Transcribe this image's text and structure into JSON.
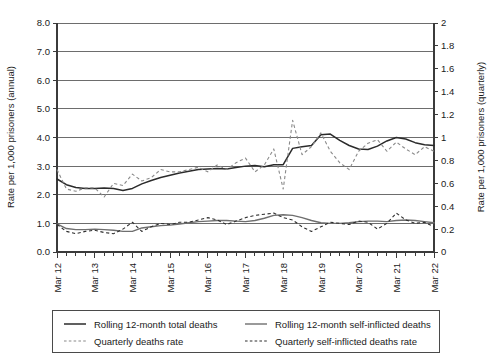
{
  "chart_data": {
    "type": "line",
    "title": "",
    "xlabel": "",
    "ylabel": "Rate per 1,000 prisoners (annual)",
    "y2label": "Rate per 1,000 prisoners (quarterly)",
    "ylim": [
      0,
      8
    ],
    "y2lim": [
      0,
      2
    ],
    "grid": true,
    "legend_position": "bottom",
    "ytick_labels": [
      "0.0",
      "1.0",
      "2.0",
      "3.0",
      "4.0",
      "5.0",
      "6.0",
      "7.0",
      "8.0"
    ],
    "ytick_values": [
      0,
      1,
      2,
      3,
      4,
      5,
      6,
      7,
      8
    ],
    "y2tick_labels": [
      "0",
      "0.2",
      "0.4",
      "0.6",
      "0.8",
      "1",
      "1.2",
      "1.4",
      "1.6",
      "1.8",
      "2"
    ],
    "y2tick_values": [
      0,
      0.2,
      0.4,
      0.6,
      0.8,
      1,
      1.2,
      1.4,
      1.6,
      1.8,
      2
    ],
    "xtick_labels": [
      "Mar 12",
      "Mar 13",
      "Mar 14",
      "Mar 15",
      "Mar 16",
      "Mar 17",
      "Mar 18",
      "Mar 19",
      "Mar 20",
      "Mar 21",
      "Mar 22"
    ],
    "x_quarters_per_year": 4,
    "x_index_range": [
      0,
      40
    ],
    "series": [
      {
        "name": "Rolling 12-month total deaths",
        "style": "solid",
        "axis": "left",
        "values": [
          2.55,
          2.35,
          2.25,
          2.22,
          2.22,
          2.24,
          2.22,
          2.15,
          2.22,
          2.38,
          2.5,
          2.6,
          2.68,
          2.76,
          2.82,
          2.88,
          2.9,
          2.92,
          2.9,
          2.95,
          3.0,
          3.02,
          2.98,
          3.05,
          3.05,
          3.62,
          3.68,
          3.72,
          4.1,
          4.12,
          3.9,
          3.72,
          3.6,
          3.58,
          3.7,
          3.88,
          4.0,
          3.95,
          3.82,
          3.75,
          3.72
        ]
      },
      {
        "name": "Quarterly deaths rate",
        "style": "dashed",
        "axis": "right",
        "values": [
          0.72,
          0.55,
          0.53,
          0.56,
          0.56,
          0.48,
          0.6,
          0.58,
          0.68,
          0.62,
          0.65,
          0.72,
          0.7,
          0.7,
          0.72,
          0.74,
          0.7,
          0.76,
          0.72,
          0.78,
          0.82,
          0.7,
          0.76,
          0.9,
          0.55,
          1.15,
          0.85,
          0.92,
          1.04,
          0.88,
          0.78,
          0.72,
          0.88,
          0.95,
          0.98,
          0.88,
          0.96,
          0.9,
          0.85,
          0.92,
          0.88
        ]
      },
      {
        "name": "Rolling 12-month self-inflicted deaths",
        "style": "solid",
        "axis": "left",
        "values": [
          0.98,
          0.82,
          0.78,
          0.78,
          0.8,
          0.78,
          0.76,
          0.72,
          0.72,
          0.84,
          0.88,
          0.92,
          0.94,
          0.98,
          1.02,
          1.06,
          1.08,
          1.1,
          1.1,
          1.08,
          1.06,
          1.1,
          1.18,
          1.28,
          1.3,
          1.28,
          1.2,
          1.1,
          1.02,
          1.0,
          1.0,
          1.02,
          1.06,
          1.08,
          1.08,
          1.06,
          1.1,
          1.12,
          1.1,
          1.06,
          1.02
        ]
      },
      {
        "name": "Quarterly self-inflicted deaths rate",
        "style": "dashed",
        "axis": "right",
        "values": [
          0.24,
          0.18,
          0.16,
          0.18,
          0.19,
          0.17,
          0.16,
          0.2,
          0.26,
          0.18,
          0.22,
          0.25,
          0.24,
          0.26,
          0.26,
          0.28,
          0.3,
          0.28,
          0.24,
          0.27,
          0.3,
          0.32,
          0.33,
          0.34,
          0.3,
          0.28,
          0.22,
          0.18,
          0.22,
          0.26,
          0.25,
          0.24,
          0.27,
          0.26,
          0.2,
          0.25,
          0.34,
          0.28,
          0.25,
          0.26,
          0.22
        ]
      }
    ]
  },
  "legend": {
    "entries": [
      {
        "label": "Rolling 12-month total deaths",
        "style": "solid"
      },
      {
        "label": "Rolling 12-month self-inflicted deaths",
        "style": "solid"
      },
      {
        "label": "Quarterly deaths rate",
        "style": "dashed"
      },
      {
        "label": "Quarterly self-inflicted deaths rate",
        "style": "dashed"
      }
    ]
  },
  "colors": {
    "total_solid": "#2b2b2b",
    "total_dashed": "#8a8a8a",
    "self_solid": "#6f6f6f",
    "self_dashed": "#2f2f2f",
    "gridline": "#6d6d6d",
    "axis": "#3b3b3b",
    "background": "#ffffff"
  }
}
